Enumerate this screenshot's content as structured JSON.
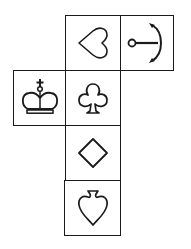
{
  "diagram": {
    "type": "cube-net",
    "stroke_color": "#1a1a1a",
    "background": "#ffffff",
    "faces": [
      {
        "id": "heart",
        "symbol": "heart",
        "label": "Heart",
        "row": 0,
        "col": 1,
        "orientation": "rotated-90-left"
      },
      {
        "id": "anchor",
        "symbol": "anchor",
        "label": "Anchor",
        "row": 0,
        "col": 2,
        "orientation": "rotated-90-right"
      },
      {
        "id": "crown",
        "symbol": "crown",
        "label": "Crown",
        "row": 1,
        "col": 0,
        "orientation": "upright"
      },
      {
        "id": "club",
        "symbol": "club",
        "label": "Club",
        "row": 1,
        "col": 1,
        "orientation": "upright"
      },
      {
        "id": "diamond",
        "symbol": "diamond",
        "label": "Diamond",
        "row": 2,
        "col": 1,
        "orientation": "upright"
      },
      {
        "id": "spade",
        "symbol": "spade",
        "label": "Spade",
        "row": 3,
        "col": 1,
        "orientation": "inverted"
      }
    ]
  }
}
